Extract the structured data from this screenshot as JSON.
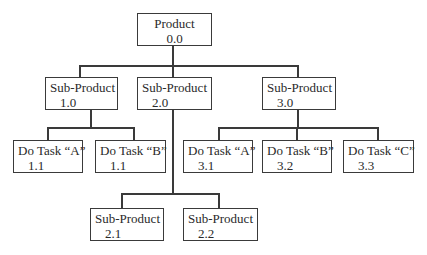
{
  "diagram": {
    "type": "hierarchy",
    "root": {
      "title": "Product",
      "number": "0.0"
    },
    "level1": [
      {
        "title": "Sub-Product",
        "number": "1.0"
      },
      {
        "title": "Sub-Product",
        "number": "2.0"
      },
      {
        "title": "Sub-Product",
        "number": "3.0"
      }
    ],
    "level2": {
      "under_1_0": [
        {
          "title": "Do Task “A”",
          "number": "1.1"
        },
        {
          "title": "Do Task “B”",
          "number": "1.1"
        }
      ],
      "under_2_0": [
        {
          "title": "Sub-Product",
          "number": "2.1"
        },
        {
          "title": "Sub-Product",
          "number": "2.2"
        }
      ],
      "under_3_0": [
        {
          "title": "Do Task “A”",
          "number": "3.1"
        },
        {
          "title": "Do Task “B”",
          "number": "3.2"
        },
        {
          "title": "Do Task “C”",
          "number": "3.3"
        }
      ]
    }
  }
}
